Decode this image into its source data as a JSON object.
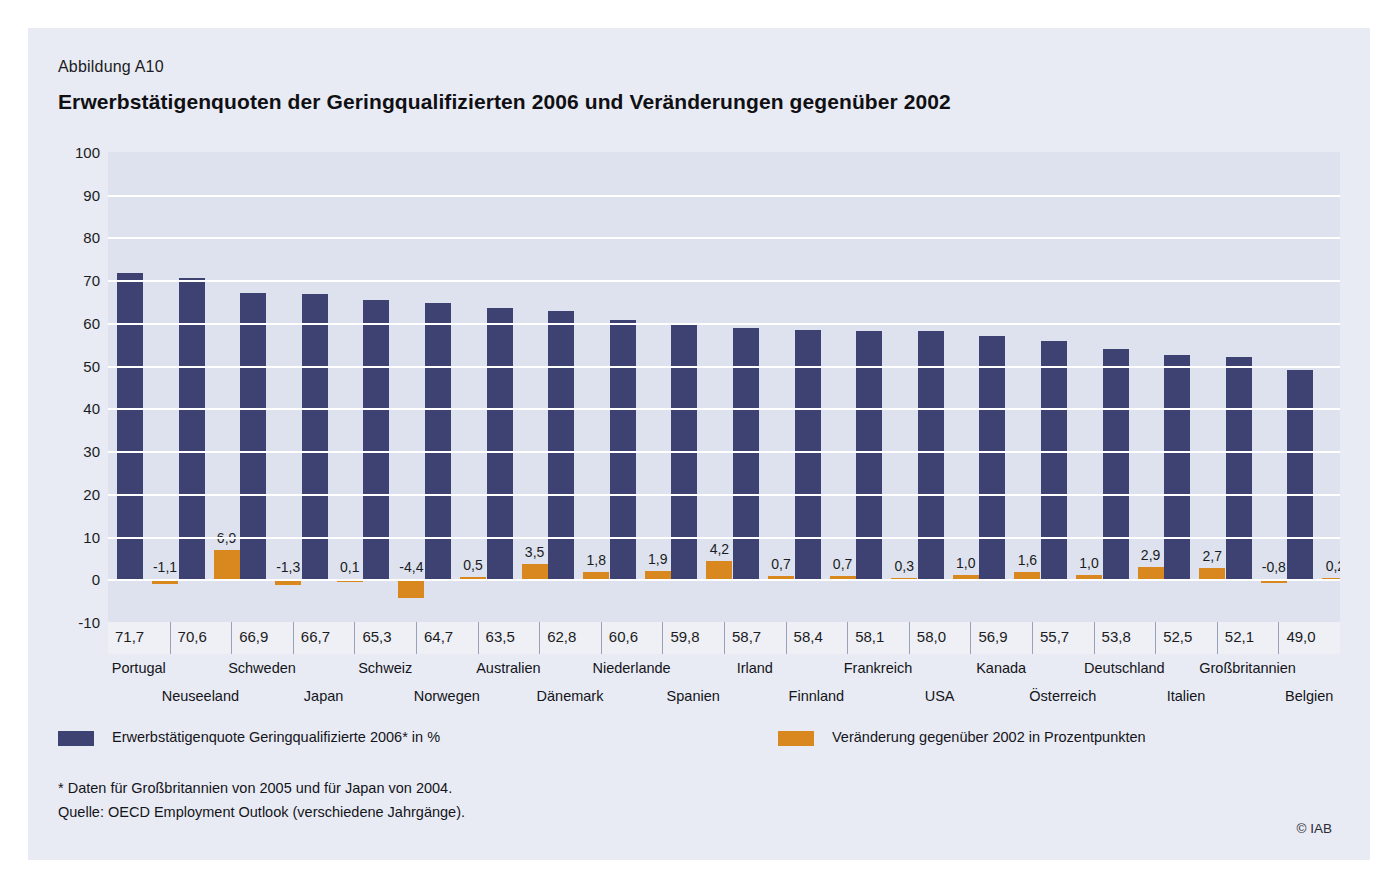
{
  "figure": {
    "number": "Abbildung A10",
    "title": "Erwerbstätigenquoten der Geringqualifizierten 2006 und Veränderungen gegenüber 2002",
    "copyright": "© IAB"
  },
  "legend": [
    {
      "label": "Erwerbstätigenquote Geringqualifizierte 2006* in %",
      "color": "#3d4272"
    },
    {
      "label": "Veränderung gegenüber 2002 in Prozentpunkten",
      "color": "#d9881f"
    }
  ],
  "footnotes": [
    "* Daten für Großbritannien von 2005 und für Japan von 2004.",
    "Quelle: OECD Employment Outlook (verschiedene Jahrgänge)."
  ],
  "chart_data": {
    "type": "bar",
    "title": "Erwerbstätigenquoten der Geringqualifizierten 2006 und Veränderungen gegenüber 2002",
    "xlabel": "",
    "ylabel": "",
    "ylim": [
      -10,
      100
    ],
    "yticks": [
      100,
      90,
      80,
      70,
      60,
      50,
      40,
      30,
      20,
      10,
      0,
      -10
    ],
    "ytick_labels": [
      "100",
      "90",
      "80",
      "70",
      "60",
      "50",
      "40",
      "30",
      "20",
      "10",
      "0",
      "-10"
    ],
    "grid": true,
    "legend_position": "below",
    "categories": [
      "Portugal",
      "Neuseeland",
      "Schweden",
      "Japan",
      "Schweiz",
      "Norwegen",
      "Australien",
      "Dänemark",
      "Niederlande",
      "Spanien",
      "Irland",
      "Finnland",
      "Frankreich",
      "USA",
      "Kanada",
      "Österreich",
      "Deutschland",
      "Italien",
      "Großbritannien",
      "Belgien"
    ],
    "series": [
      {
        "name": "Erwerbstätigenquote Geringqualifizierte 2006* in %",
        "color": "#3d4272",
        "values": [
          71.7,
          70.6,
          66.9,
          66.7,
          65.3,
          64.7,
          63.5,
          62.8,
          60.6,
          59.8,
          58.7,
          58.4,
          58.1,
          58.0,
          56.9,
          55.7,
          53.8,
          52.5,
          52.1,
          49.0
        ],
        "labels": [
          "71,7",
          "70,6",
          "66,9",
          "66,7",
          "65,3",
          "64,7",
          "63,5",
          "62,8",
          "60,6",
          "59,8",
          "58,7",
          "58,4",
          "58,1",
          "58,0",
          "56,9",
          "55,7",
          "53,8",
          "52,5",
          "52,1",
          "49,0"
        ]
      },
      {
        "name": "Veränderung gegenüber 2002 in Prozentpunkten",
        "color": "#d9881f",
        "values": [
          -1.1,
          6.9,
          -1.3,
          0.1,
          -4.4,
          0.5,
          3.5,
          1.8,
          1.9,
          4.2,
          0.7,
          0.7,
          0.3,
          1.0,
          1.6,
          1.0,
          2.9,
          2.7,
          -0.8,
          0.2
        ],
        "labels": [
          "-1,1",
          "6,9",
          "-1,3",
          "0,1",
          "-4,4",
          "0,5",
          "3,5",
          "1,8",
          "1,9",
          "4,2",
          "0,7",
          "0,7",
          "0,3",
          "1,0",
          "1,6",
          "1,0",
          "2,9",
          "2,7",
          "-0,8",
          "0,2"
        ]
      }
    ]
  }
}
